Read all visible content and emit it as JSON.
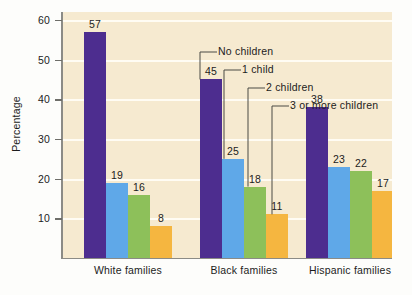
{
  "chart_data": {
    "type": "bar",
    "title": "",
    "xlabel": "",
    "ylabel": "Percentage",
    "ylim": [
      0,
      62
    ],
    "grid": true,
    "legend_position": "callout-annotations",
    "categories": [
      "White families",
      "Black families",
      "Hispanic families"
    ],
    "series": [
      {
        "name": "No children",
        "color": "#4d2d8f",
        "values": [
          57,
          45,
          38
        ]
      },
      {
        "name": "1 child",
        "color": "#5fa8e8",
        "values": [
          19,
          25,
          23
        ]
      },
      {
        "name": "2 children",
        "color": "#8dc05a",
        "values": [
          16,
          18,
          22
        ]
      },
      {
        "name": "3 or more children",
        "color": "#f5b640",
        "values": [
          8,
          11,
          17
        ]
      }
    ],
    "yticks": [
      10,
      20,
      30,
      40,
      50,
      60
    ],
    "ytick_labels": [
      "10",
      "20",
      "30",
      "40",
      "50",
      "60"
    ],
    "annotations": [
      {
        "text": "No children",
        "target_group": "Black families",
        "target_series": "No children"
      },
      {
        "text": "1 child",
        "target_group": "Black families",
        "target_series": "1 child"
      },
      {
        "text": "2 children",
        "target_group": "Black families",
        "target_series": "2 children"
      },
      {
        "text": "3 or more children",
        "target_group": "Black families",
        "target_series": "3 or more children"
      }
    ]
  },
  "colors": {
    "plot_background": "#f6ead0",
    "page_background": "#fdfdfb",
    "gridline": "#fffdf4",
    "axis": "#8b8b86",
    "text": "#1c1c1c"
  }
}
